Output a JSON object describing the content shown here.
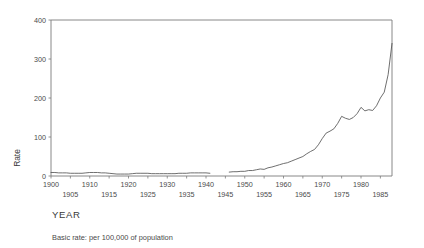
{
  "chart_data": {
    "type": "line",
    "title": "",
    "xlabel": "YEAR",
    "ylabel": "Rate",
    "footnote": "Basic rate: per 100,000 of population",
    "xlim": [
      1900,
      1988
    ],
    "ylim": [
      0,
      400
    ],
    "grid": false,
    "legend": null,
    "y_ticks": [
      0,
      100,
      200,
      300,
      400
    ],
    "y_tick_labels": [
      "0",
      "100",
      "200",
      "300",
      "400"
    ],
    "x_ticks": [
      1900,
      1905,
      1910,
      1915,
      1920,
      1925,
      1930,
      1935,
      1940,
      1945,
      1950,
      1955,
      1960,
      1965,
      1970,
      1975,
      1980,
      1985
    ],
    "x_tick_labels_upper": [
      "1900",
      "1910",
      "1920",
      "1930",
      "1940",
      "1950",
      "1960",
      "1970",
      "1980"
    ],
    "x_tick_values_upper": [
      1900,
      1910,
      1920,
      1930,
      1940,
      1950,
      1960,
      1970,
      1980
    ],
    "x_tick_labels_lower": [
      "1905",
      "1915",
      "1925",
      "1935",
      "1945",
      "1955",
      "1965",
      "1975",
      "1985"
    ],
    "x_tick_values_lower": [
      1905,
      1915,
      1925,
      1935,
      1945,
      1955,
      1965,
      1975,
      1985
    ],
    "line_color": "#555555",
    "axis_color": "#7a7a7a",
    "series": [
      {
        "name": "Basic rate",
        "segments": [
          {
            "x": [
              1900,
              1901,
              1902,
              1903,
              1904,
              1905,
              1906,
              1907,
              1908,
              1909,
              1910,
              1911,
              1912,
              1913,
              1914,
              1915,
              1916,
              1917,
              1918,
              1919,
              1920,
              1921,
              1922,
              1923,
              1924,
              1925,
              1926,
              1927,
              1928,
              1929,
              1930,
              1931,
              1932,
              1933,
              1934,
              1935,
              1936,
              1937,
              1938,
              1939,
              1940,
              1941
            ],
            "y": [
              9,
              9,
              8,
              8,
              8,
              7,
              7,
              7,
              7,
              8,
              9,
              9,
              9,
              8,
              8,
              7,
              6,
              5,
              5,
              5,
              5,
              6,
              7,
              7,
              7,
              7,
              6,
              6,
              6,
              6,
              6,
              6,
              6,
              7,
              7,
              7,
              8,
              8,
              8,
              8,
              8,
              7
            ]
          },
          {
            "x": [
              1946,
              1947,
              1948,
              1949,
              1950,
              1951,
              1952,
              1953,
              1954,
              1955,
              1956,
              1957,
              1958,
              1959,
              1960,
              1961,
              1962,
              1963,
              1964,
              1965,
              1966,
              1967,
              1968,
              1969,
              1970,
              1971,
              1972,
              1973,
              1974,
              1975,
              1976,
              1977,
              1978,
              1979,
              1980,
              1981,
              1982,
              1983,
              1984,
              1985,
              1986,
              1987,
              1988
            ],
            "y": [
              10,
              11,
              11,
              12,
              12,
              14,
              14,
              16,
              18,
              17,
              21,
              23,
              26,
              29,
              32,
              34,
              38,
              42,
              46,
              50,
              57,
              63,
              68,
              80,
              96,
              110,
              115,
              121,
              135,
              153,
              148,
              145,
              150,
              160,
              176,
              167,
              170,
              168,
              180,
              200,
              215,
              260,
              340
            ]
          }
        ]
      }
    ]
  },
  "plot_geometry": {
    "left": 51,
    "right": 392,
    "top": 20,
    "bottom": 176
  }
}
